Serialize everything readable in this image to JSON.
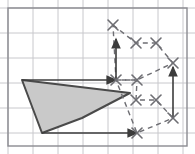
{
  "figure": {
    "canvas": {
      "width": 195,
      "height": 154
    },
    "background_color": "#ffffff",
    "grid": {
      "line_color": "#c8c8cc",
      "border_color": "#8a8a90",
      "cell_size": 25,
      "origin_x": 8,
      "origin_y": 8,
      "cols": 7,
      "rows": 5,
      "visible": true,
      "border_rect": {
        "x": 8,
        "y": 8,
        "width": 179,
        "height": 138
      }
    },
    "source_shape": {
      "name": "source-polygon",
      "fill_color": "#c9c9c9",
      "stroke_color": "#4a4a4a",
      "stroke_width": 2,
      "points": "22,80 130,93 82,118 42,133"
    },
    "arrows": {
      "color": "#3c3c3c",
      "width": 1.6,
      "head_size": 6,
      "items": [
        {
          "name": "arrow-horizontal-top",
          "x1": 22,
          "y1": 80,
          "x2": 116,
          "y2": 80
        },
        {
          "name": "arrow-vertical-left",
          "x1": 116,
          "y1": 80,
          "x2": 116,
          "y2": 39
        },
        {
          "name": "arrow-horizontal-bottom",
          "x1": 42,
          "y1": 133,
          "x2": 137,
          "y2": 133
        },
        {
          "name": "arrow-vertical-right",
          "x1": 173,
          "y1": 118,
          "x2": 173,
          "y2": 67
        }
      ]
    },
    "dashed_shapes": {
      "stroke_color": "#6e6e73",
      "stroke_width": 1.4,
      "dash_pattern": "5,4",
      "marker_color": "#6e6e73",
      "marker_size": 5,
      "marker_stroke": 1.6,
      "items": [
        {
          "name": "transformed-shape-upper",
          "points": "113,25 136,43 156,43 173,63 137,80 116,80",
          "closed": true
        },
        {
          "name": "transformed-shape-lower",
          "points": "116,80 137,80 136,100 156,100 173,118 137,133",
          "closed": true
        }
      ]
    },
    "vertex_markers": [
      {
        "name": "vertex-marker-top",
        "x": 113,
        "y": 25
      },
      {
        "name": "vertex-marker-upper-mid-left",
        "x": 136,
        "y": 43
      },
      {
        "name": "vertex-marker-upper-mid-right",
        "x": 156,
        "y": 43
      },
      {
        "name": "vertex-marker-upper-right",
        "x": 173,
        "y": 63
      },
      {
        "name": "vertex-marker-center-left",
        "x": 116,
        "y": 80
      },
      {
        "name": "vertex-marker-center-right",
        "x": 137,
        "y": 80
      },
      {
        "name": "vertex-marker-lower-mid-left",
        "x": 136,
        "y": 100
      },
      {
        "name": "vertex-marker-lower-mid-right",
        "x": 156,
        "y": 100
      },
      {
        "name": "vertex-marker-lower-right",
        "x": 173,
        "y": 118
      },
      {
        "name": "vertex-marker-bottom",
        "x": 137,
        "y": 133
      }
    ]
  }
}
